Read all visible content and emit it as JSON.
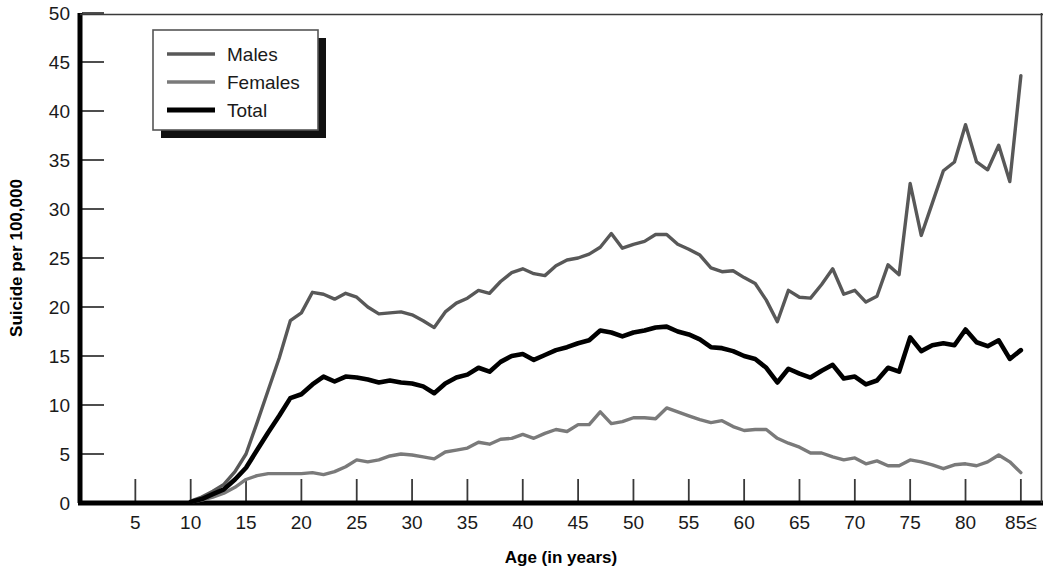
{
  "chart_data": {
    "type": "line",
    "title": "",
    "xlabel": "Age (in years)",
    "ylabel": "Suicide per 100,000",
    "xlim": [
      0,
      87
    ],
    "ylim": [
      0,
      50
    ],
    "xticks": [
      5,
      10,
      15,
      20,
      25,
      30,
      35,
      40,
      45,
      50,
      55,
      60,
      65,
      70,
      75,
      80,
      85
    ],
    "xtick_labels": [
      "5",
      "10",
      "15",
      "20",
      "25",
      "30",
      "35",
      "40",
      "45",
      "50",
      "55",
      "60",
      "65",
      "70",
      "75",
      "80",
      "85≤"
    ],
    "yticks": [
      0,
      5,
      10,
      15,
      20,
      25,
      30,
      35,
      40,
      45,
      50
    ],
    "ytick_labels": [
      "0",
      "5",
      "10",
      "15",
      "20",
      "25",
      "30",
      "35",
      "40",
      "45",
      "50"
    ],
    "grid": false,
    "legend_position": "top-left",
    "x": [
      10,
      11,
      12,
      13,
      14,
      15,
      16,
      17,
      18,
      19,
      20,
      21,
      22,
      23,
      24,
      25,
      26,
      27,
      28,
      29,
      30,
      31,
      32,
      33,
      34,
      35,
      36,
      37,
      38,
      39,
      40,
      41,
      42,
      43,
      44,
      45,
      46,
      47,
      48,
      49,
      50,
      51,
      52,
      53,
      54,
      55,
      56,
      57,
      58,
      59,
      60,
      61,
      62,
      63,
      64,
      65,
      66,
      67,
      68,
      69,
      70,
      71,
      72,
      73,
      74,
      75,
      76,
      77,
      78,
      79,
      80,
      81,
      82,
      83,
      84,
      85
    ],
    "series": [
      {
        "name": "Males",
        "color": "#585858",
        "values": [
          0.2,
          0.6,
          1.2,
          1.9,
          3.2,
          5.0,
          8.2,
          11.5,
          14.8,
          18.6,
          19.4,
          21.5,
          21.3,
          20.8,
          21.4,
          21.0,
          20.0,
          19.3,
          19.4,
          19.5,
          19.2,
          18.6,
          17.9,
          19.5,
          20.4,
          20.9,
          21.7,
          21.4,
          22.6,
          23.5,
          23.9,
          23.4,
          23.2,
          24.2,
          24.8,
          25.0,
          25.4,
          26.1,
          27.5,
          26.0,
          26.4,
          26.7,
          27.4,
          27.4,
          26.4,
          25.9,
          25.3,
          24.0,
          23.6,
          23.7,
          23.0,
          22.4,
          20.7,
          18.5,
          21.7,
          21.0,
          20.9,
          22.3,
          23.9,
          21.3,
          21.7,
          20.5,
          21.1,
          24.3,
          23.3,
          32.6,
          27.3,
          30.6,
          33.9,
          34.8,
          38.6,
          34.8,
          34.0,
          36.5,
          32.8,
          43.6
        ]
      },
      {
        "name": "Females",
        "color": "#7a7a7a",
        "values": [
          0.1,
          0.3,
          0.6,
          1.0,
          1.6,
          2.4,
          2.8,
          3.0,
          3.0,
          3.0,
          3.0,
          3.1,
          2.9,
          3.2,
          3.7,
          4.4,
          4.2,
          4.4,
          4.8,
          5.0,
          4.9,
          4.7,
          4.5,
          5.2,
          5.4,
          5.6,
          6.2,
          6.0,
          6.5,
          6.6,
          7.0,
          6.6,
          7.1,
          7.5,
          7.3,
          8.0,
          8.0,
          9.3,
          8.1,
          8.3,
          8.7,
          8.7,
          8.6,
          9.7,
          9.3,
          8.9,
          8.5,
          8.2,
          8.4,
          7.8,
          7.4,
          7.5,
          7.5,
          6.6,
          6.1,
          5.7,
          5.1,
          5.1,
          4.7,
          4.4,
          4.6,
          4.0,
          4.3,
          3.8,
          3.8,
          4.4,
          4.2,
          3.9,
          3.5,
          3.9,
          4.0,
          3.8,
          4.2,
          4.9,
          4.2,
          3.1
        ]
      },
      {
        "name": "Total",
        "color": "#000000",
        "values": [
          0.1,
          0.4,
          0.9,
          1.4,
          2.4,
          3.6,
          5.4,
          7.2,
          8.9,
          10.7,
          11.1,
          12.1,
          12.9,
          12.4,
          12.9,
          12.8,
          12.6,
          12.3,
          12.5,
          12.3,
          12.2,
          11.9,
          11.2,
          12.2,
          12.8,
          13.1,
          13.8,
          13.4,
          14.4,
          15.0,
          15.2,
          14.6,
          15.1,
          15.6,
          15.9,
          16.3,
          16.6,
          17.6,
          17.4,
          17.0,
          17.4,
          17.6,
          17.9,
          18.0,
          17.5,
          17.2,
          16.7,
          15.9,
          15.8,
          15.5,
          15.0,
          14.7,
          13.8,
          12.3,
          13.7,
          13.2,
          12.8,
          13.5,
          14.1,
          12.7,
          12.9,
          12.1,
          12.5,
          13.8,
          13.4,
          16.9,
          15.5,
          16.1,
          16.3,
          16.1,
          17.7,
          16.4,
          16.0,
          16.6,
          14.7,
          15.6
        ]
      }
    ]
  },
  "legend": {
    "items": [
      {
        "label": "Males"
      },
      {
        "label": "Females"
      },
      {
        "label": "Total"
      }
    ]
  }
}
